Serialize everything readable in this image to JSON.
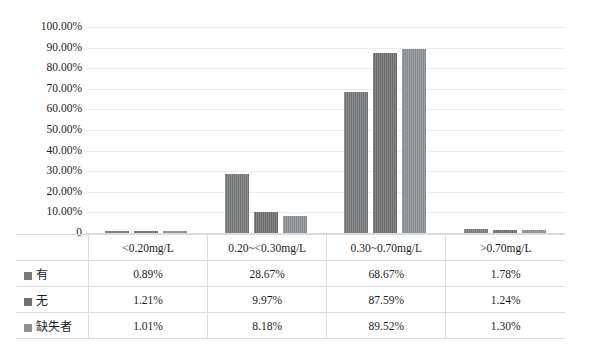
{
  "chart_data": {
    "type": "bar",
    "title": "",
    "xlabel": "",
    "ylabel": "",
    "ylim": [
      0,
      100
    ],
    "grid": true,
    "legend_position": "table-left",
    "categories": [
      "<0.20mg/L",
      "0.20~<0.30mg/L",
      "0.30~0.70mg/L",
      ">0.70mg/L"
    ],
    "ytick_labels": [
      "100.00%",
      "90.00%",
      "80.00%",
      "70.00%",
      "60.00%",
      "50.00%",
      "40.00%",
      "30.00%",
      "20.00%",
      "10.00%",
      "0"
    ],
    "ytick_values": [
      100,
      90,
      80,
      70,
      60,
      50,
      40,
      30,
      20,
      10,
      0
    ],
    "series": [
      {
        "name": "有",
        "color": "#77797b",
        "values": [
          0.89,
          28.67,
          68.67,
          1.78
        ],
        "labels": [
          "0.89%",
          "28.67%",
          "68.67%",
          "1.78%"
        ]
      },
      {
        "name": "无",
        "color": "#6e7072",
        "values": [
          1.21,
          9.97,
          87.59,
          1.24
        ],
        "labels": [
          "1.21%",
          "9.97%",
          "87.59%",
          "1.24%"
        ]
      },
      {
        "name": "缺失者",
        "color": "#8d9093",
        "values": [
          1.01,
          8.18,
          89.52,
          1.3
        ],
        "labels": [
          "1.01%",
          "8.18%",
          "89.52%",
          "1.30%"
        ]
      }
    ]
  },
  "table": {
    "column_headers": [
      "<0.20mg/L",
      "0.20~<0.30mg/L",
      "0.30~0.70mg/L",
      ">0.70mg/L"
    ],
    "rows": [
      {
        "label": "有",
        "values": [
          "0.89%",
          "28.67%",
          "68.67%",
          "1.78%"
        ]
      },
      {
        "label": "无",
        "values": [
          "1.21%",
          "9.97%",
          "87.59%",
          "1.24%"
        ]
      },
      {
        "label": "缺失者",
        "values": [
          "1.01%",
          "8.18%",
          "89.52%",
          "1.30%"
        ]
      }
    ]
  },
  "colors": {
    "series_0": "#77797b",
    "series_1": "#6e7072",
    "series_2": "#8d9093",
    "gridline": "#eceff1",
    "table_border": "#dcdfe2",
    "text": "#1d1d1d",
    "background": "#ffffff"
  }
}
